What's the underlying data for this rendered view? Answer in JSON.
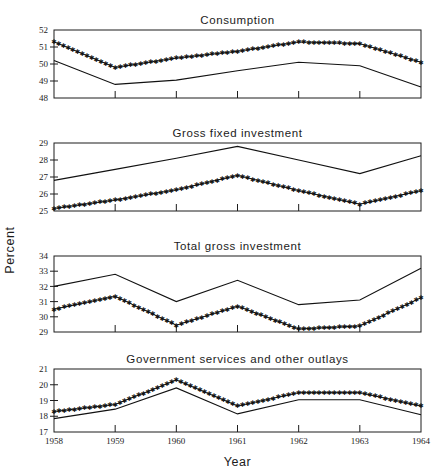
{
  "figure": {
    "ylabel": "Percent",
    "xlabel": "Year",
    "x_tick_labels": [
      "1958",
      "1959",
      "1960",
      "1961",
      "1962",
      "1963",
      "1964"
    ]
  },
  "chart_data": [
    {
      "type": "line",
      "title": "Consumption",
      "xlabel": "Year",
      "ylabel": "Percent",
      "x": [
        1958,
        1959,
        1960,
        1961,
        1962,
        1963,
        1964
      ],
      "xlim": [
        1958,
        1964
      ],
      "ylim": [
        48,
        52
      ],
      "yticks": [
        48,
        49,
        50,
        51,
        52
      ],
      "grid": false,
      "legend": "none",
      "series": [
        {
          "name": "starred-series",
          "marker": "star",
          "values": [
            51.3,
            49.8,
            50.35,
            50.75,
            51.3,
            51.2,
            50.1
          ]
        },
        {
          "name": "solid-series",
          "marker": "none",
          "values": [
            50.2,
            48.8,
            49.05,
            49.6,
            50.1,
            49.9,
            48.65
          ]
        }
      ]
    },
    {
      "type": "line",
      "title": "Gross fixed investment",
      "xlabel": "Year",
      "ylabel": "Percent",
      "x": [
        1958,
        1959,
        1960,
        1961,
        1962,
        1963,
        1964
      ],
      "xlim": [
        1958,
        1964
      ],
      "ylim": [
        25,
        29
      ],
      "yticks": [
        25,
        26,
        27,
        28,
        29
      ],
      "grid": false,
      "legend": "none",
      "series": [
        {
          "name": "solid-series",
          "marker": "none",
          "values": [
            26.8,
            27.45,
            28.1,
            28.8,
            28.0,
            27.2,
            28.25
          ]
        },
        {
          "name": "starred-series",
          "marker": "star",
          "values": [
            25.15,
            25.65,
            26.25,
            27.1,
            26.2,
            25.4,
            26.2
          ]
        }
      ]
    },
    {
      "type": "line",
      "title": "Total gross investment",
      "xlabel": "Year",
      "ylabel": "Percent",
      "x": [
        1958,
        1959,
        1960,
        1961,
        1962,
        1963,
        1964
      ],
      "xlim": [
        1958,
        1964
      ],
      "ylim": [
        29,
        34
      ],
      "yticks": [
        29,
        30,
        31,
        32,
        33,
        34
      ],
      "grid": false,
      "legend": "none",
      "series": [
        {
          "name": "solid-series",
          "marker": "none",
          "values": [
            32.0,
            32.8,
            31.0,
            32.4,
            30.8,
            31.1,
            33.2
          ]
        },
        {
          "name": "starred-series",
          "marker": "star",
          "values": [
            30.5,
            31.35,
            29.45,
            30.7,
            29.2,
            29.4,
            31.25
          ]
        }
      ]
    },
    {
      "type": "line",
      "title": "Government services and other outlays",
      "xlabel": "Year",
      "ylabel": "Percent",
      "x": [
        1958,
        1959,
        1960,
        1961,
        1962,
        1963,
        1964
      ],
      "xlim": [
        1958,
        1964
      ],
      "ylim": [
        17,
        21
      ],
      "yticks": [
        17,
        18,
        19,
        20,
        21
      ],
      "grid": false,
      "legend": "none",
      "series": [
        {
          "name": "starred-series",
          "marker": "star",
          "values": [
            18.3,
            18.75,
            20.3,
            18.65,
            19.5,
            19.5,
            18.65
          ]
        },
        {
          "name": "solid-series",
          "marker": "none",
          "values": [
            17.85,
            18.45,
            19.8,
            18.15,
            19.05,
            19.05,
            18.1
          ]
        }
      ]
    }
  ]
}
